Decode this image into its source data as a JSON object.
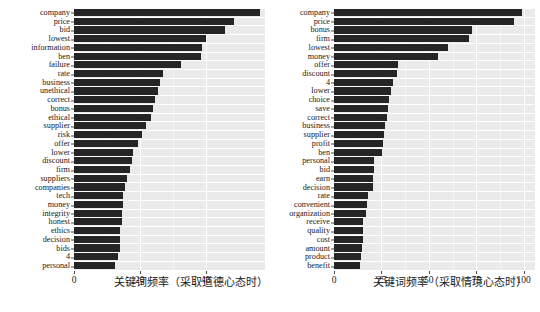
{
  "chart_data": [
    {
      "type": "bar",
      "orientation": "horizontal",
      "panel": "left",
      "title": "",
      "xlabel": "关键词频率（采取道德心态时）",
      "ylabel": "",
      "xlim": [
        0,
        58
      ],
      "xticks": [
        0,
        20,
        40
      ],
      "xticklabels": [
        "0",
        "20",
        "40"
      ],
      "grid": true,
      "bar_color": "#252525",
      "plot_bg": "#eaeaea",
      "categories": [
        "company",
        "price",
        "bid",
        "lowest",
        "information",
        "ben",
        "failure",
        "rate",
        "business",
        "unethical",
        "correct",
        "bonus",
        "ethical",
        "supplier",
        "risk",
        "offer",
        "lower",
        "discount",
        "firm",
        "suppliers",
        "companies",
        "tech",
        "money",
        "integrity",
        "honest",
        "ethics",
        "decision",
        "bids",
        "4",
        "personal"
      ],
      "values": [
        56.5,
        48.5,
        46.0,
        40.0,
        39.0,
        38.5,
        32.5,
        27.0,
        26.0,
        25.5,
        24.5,
        24.0,
        23.5,
        22.0,
        20.5,
        19.5,
        18.0,
        17.5,
        17.0,
        16.0,
        15.5,
        15.0,
        15.0,
        14.5,
        14.5,
        14.0,
        14.0,
        14.0,
        13.5,
        12.5
      ]
    },
    {
      "type": "bar",
      "orientation": "horizontal",
      "panel": "right",
      "title": "",
      "xlabel": "关键词频率（采取情境心态时）",
      "ylabel": "",
      "xlim": [
        0,
        106
      ],
      "xticks": [
        0,
        25,
        50,
        75,
        100
      ],
      "xticklabels": [
        "0",
        "25",
        "50",
        "75",
        "100"
      ],
      "grid": true,
      "bar_color": "#252525",
      "plot_bg": "#eaeaea",
      "categories": [
        "company",
        "price",
        "bonus",
        "firm",
        "lowest",
        "money",
        "offer",
        "discount",
        "4",
        "lower",
        "choice",
        "save",
        "correct",
        "business",
        "supplier",
        "profit",
        "ben",
        "personal",
        "bid",
        "earn",
        "decision",
        "rate",
        "convenient",
        "organization",
        "receive",
        "quality",
        "cost",
        "amount",
        "product",
        "benefit"
      ],
      "values": [
        99.0,
        95.0,
        73.0,
        71.0,
        60.0,
        55.0,
        34.0,
        33.0,
        31.0,
        30.0,
        29.0,
        28.5,
        28.0,
        27.0,
        26.5,
        26.0,
        25.5,
        21.0,
        21.0,
        20.5,
        20.5,
        18.0,
        17.5,
        17.0,
        15.5,
        15.5,
        15.5,
        15.0,
        14.0,
        13.5
      ]
    }
  ]
}
